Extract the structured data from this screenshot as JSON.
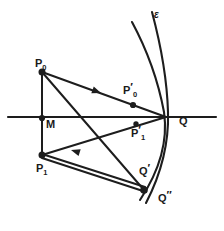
{
  "figure": {
    "kind": "geometric-ray-diagram",
    "background_color": "#ffffff",
    "stroke_color": "#1d1d1d",
    "width": 224,
    "height": 231
  },
  "labels": {
    "epsilon": {
      "text": "ε",
      "x": 154,
      "y": 10
    },
    "p0": {
      "base": "P",
      "sub": "0",
      "prime": "",
      "x": 35,
      "y": 58
    },
    "p0_prime": {
      "base": "P",
      "sub": "0",
      "prime": "′",
      "x": 123,
      "y": 85
    },
    "m": {
      "base": "M",
      "sub": "",
      "prime": "",
      "x": 46,
      "y": 119
    },
    "p1_prime": {
      "base": "P",
      "sub": "1",
      "prime": "′",
      "x": 131,
      "y": 128
    },
    "q": {
      "base": "Q",
      "sub": "",
      "prime": "",
      "x": 179,
      "y": 116
    },
    "p1": {
      "base": "P",
      "sub": "1",
      "prime": "",
      "x": 36,
      "y": 163
    },
    "q_prime": {
      "base": "Q",
      "sub": "",
      "prime": "′",
      "x": 139,
      "y": 166
    },
    "q_double_prime": {
      "base": "Q",
      "sub": "",
      "prime": "″",
      "x": 158,
      "y": 193
    }
  },
  "points": {
    "p0": {
      "x": 42,
      "y": 72,
      "r": 3.4
    },
    "m": {
      "x": 42,
      "y": 118,
      "r": 3.0
    },
    "p1": {
      "x": 42,
      "y": 155,
      "r": 3.4
    },
    "q": {
      "x": 166,
      "y": 117,
      "r": 0
    },
    "p0_prime": {
      "x": 133,
      "y": 105,
      "r": 3.0
    },
    "p1_prime": {
      "x": 136,
      "y": 124,
      "r": 2.6
    },
    "q_double_prime": {
      "x": 144,
      "y": 190,
      "r": 3.6
    }
  },
  "axis": {
    "name": "optical-axis",
    "x1": 8,
    "y1": 117,
    "x2": 216,
    "y2": 117
  },
  "segments": [
    {
      "name": "vertical-p0-p1",
      "x1": 42,
      "y1": 72,
      "x2": 42,
      "y2": 155
    },
    {
      "name": "ray-p0-to-q",
      "x1": 42,
      "y1": 72,
      "x2": 166,
      "y2": 117
    },
    {
      "name": "ray-p0-to-qdd",
      "x1": 42,
      "y1": 72,
      "x2": 144,
      "y2": 190
    },
    {
      "name": "ray-q-to-p1",
      "x1": 166,
      "y1": 117,
      "x2": 42,
      "y2": 155
    },
    {
      "name": "ray-p1-to-qdd-upper",
      "x1": 42,
      "y1": 155,
      "x2": 144,
      "y2": 188
    },
    {
      "name": "ray-p1-to-qdd-lower",
      "x1": 42,
      "y1": 157,
      "x2": 144,
      "y2": 191
    }
  ],
  "arrows": [
    {
      "name": "arrow-on-p0-q-ray",
      "x": 97,
      "y": 91,
      "angle": 20
    },
    {
      "name": "arrow-on-q-p1-ray",
      "x": 80,
      "y": 148,
      "angle": 197
    }
  ],
  "curves": [
    {
      "name": "wavefront-outer",
      "d": "M 132 22 C 146 48, 158 80, 164 112 C 168 140, 160 170, 140 200"
    },
    {
      "name": "wavefront-inner",
      "d": "M 152 12 C 160 42, 167 78, 168 112 C 169 144, 160 176, 146 203"
    }
  ]
}
